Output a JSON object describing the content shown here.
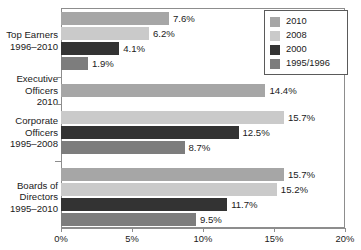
{
  "chart_data": {
    "type": "bar",
    "orientation": "horizontal",
    "title": "",
    "xlabel": "",
    "ylabel": "",
    "xlim": [
      0,
      20
    ],
    "xtick_labels": [
      "0%",
      "5%",
      "10%",
      "15%",
      "20%"
    ],
    "xticks": [
      0,
      5,
      10,
      15,
      20
    ],
    "grid": false,
    "legend_position": "top-right",
    "value_suffix": "%",
    "legend": [
      {
        "name": "2010",
        "color": "#a6a6a6"
      },
      {
        "name": "2008",
        "color": "#cacaca"
      },
      {
        "name": "2000",
        "color": "#333333"
      },
      {
        "name": "1995/1996",
        "color": "#7d7d7d"
      }
    ],
    "categories": [
      {
        "lines": [
          "Top Earners",
          "1996–2010"
        ],
        "bars": [
          {
            "series": "2010",
            "value": 7.6,
            "label": "7.6%",
            "color": "#a6a6a6"
          },
          {
            "series": "2008",
            "value": 6.2,
            "label": "6.2%",
            "color": "#cacaca"
          },
          {
            "series": "2000",
            "value": 4.1,
            "label": "4.1%",
            "color": "#333333"
          },
          {
            "series": "1995/1996",
            "value": 1.9,
            "label": "1.9%",
            "color": "#7d7d7d"
          }
        ]
      },
      {
        "lines": [
          "Executive",
          "Officers",
          "2010"
        ],
        "bars": [
          {
            "series": "2010",
            "value": 14.4,
            "label": "14.4%",
            "color": "#a6a6a6"
          }
        ]
      },
      {
        "lines": [
          "Corporate",
          "Officers",
          "1995–2008"
        ],
        "bars": [
          {
            "series": "2008",
            "value": 15.7,
            "label": "15.7%",
            "color": "#cacaca"
          },
          {
            "series": "2000",
            "value": 12.5,
            "label": "12.5%",
            "color": "#333333"
          },
          {
            "series": "1995/1996",
            "value": 8.7,
            "label": "8.7%",
            "color": "#7d7d7d"
          }
        ]
      },
      {
        "lines": [
          "Boards of",
          "Directors",
          "1995–2010"
        ],
        "bars": [
          {
            "series": "2010",
            "value": 15.7,
            "label": "15.7%",
            "color": "#a6a6a6"
          },
          {
            "series": "2008",
            "value": 15.2,
            "label": "15.2%",
            "color": "#cacaca"
          },
          {
            "series": "2000",
            "value": 11.7,
            "label": "11.7%",
            "color": "#333333"
          },
          {
            "series": "1995/1996",
            "value": 9.5,
            "label": "9.5%",
            "color": "#7d7d7d"
          }
        ]
      }
    ]
  }
}
